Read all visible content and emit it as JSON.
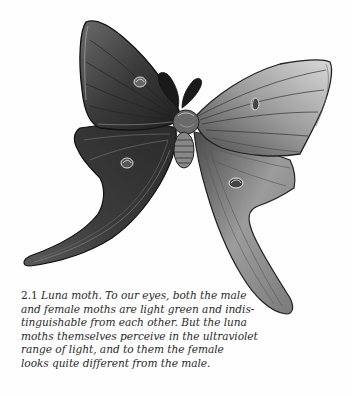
{
  "figure": {
    "colors": {
      "ink": "#1c1c1c",
      "mid": "#5a5a5a",
      "light": "#b8b8b8",
      "paper": "#fefefe"
    }
  },
  "caption": {
    "number": "2.1",
    "lines": [
      " Luna moth. To our eyes, both the male",
      "and female moths are light green and indis-",
      "tinguishable from each other. But the luna",
      "moths themselves perceive in the ultraviolet",
      "range of light, and to them the female",
      "looks quite different from the male."
    ]
  }
}
